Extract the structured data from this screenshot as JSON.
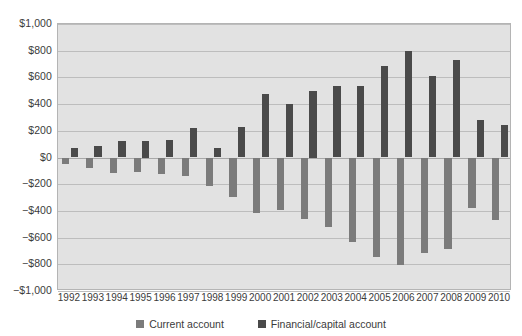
{
  "chart_data": {
    "type": "bar",
    "title": "",
    "subtitle": "",
    "xlabel": "",
    "ylabel": "",
    "grid": true,
    "legend_position": "bottom",
    "ylim": [
      -1000,
      1000
    ],
    "ytick_step": 200,
    "ytick_labels": [
      "$1,000",
      "$800",
      "$600",
      "$400",
      "$200",
      "$0",
      "−$200",
      "−$400",
      "−$600",
      "−$800",
      "−$1,000"
    ],
    "ytick_values": [
      1000,
      800,
      600,
      400,
      200,
      0,
      -200,
      -400,
      -600,
      -800,
      -1000
    ],
    "categories": [
      "1992",
      "1993",
      "1994",
      "1995",
      "1996",
      "1997",
      "1998",
      "1999",
      "2000",
      "2001",
      "2002",
      "2003",
      "2004",
      "2005",
      "2006",
      "2007",
      "2008",
      "2009",
      "2010"
    ],
    "series": [
      {
        "name": "Current account",
        "color": "#7b7b7b",
        "values": [
          -50,
          -82,
          -118,
          -110,
          -120,
          -136,
          -210,
          -297,
          -416,
          -397,
          -458,
          -521,
          -632,
          -749,
          -807,
          -719,
          -687,
          -377,
          -471
        ]
      },
      {
        "name": "Financial/capital account",
        "color": "#4a4a4a",
        "values": [
          70,
          87,
          122,
          125,
          130,
          222,
          72,
          228,
          477,
          400,
          500,
          533,
          532,
          685,
          798,
          614,
          734,
          284,
          241
        ]
      }
    ]
  },
  "legend": {
    "items": [
      {
        "label": "Current account",
        "swatch": "current"
      },
      {
        "label": "Financial/capital account",
        "swatch": "financial"
      }
    ]
  }
}
